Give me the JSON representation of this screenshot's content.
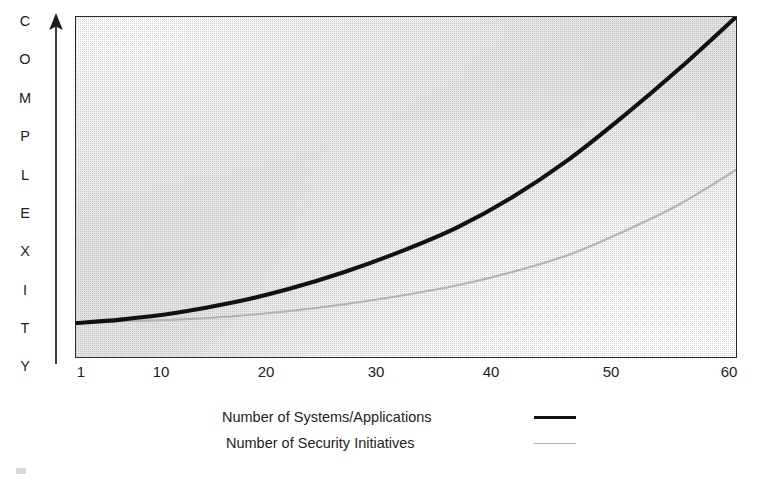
{
  "figure": {
    "y_axis_title": "COMPLEXITY",
    "y_axis_letters": [
      "C",
      "O",
      "M",
      "P",
      "L",
      "E",
      "X",
      "I",
      "T",
      "Y"
    ],
    "arrow_icon": "up-arrow-icon"
  },
  "legend": {
    "position": "below-plot",
    "items": [
      {
        "label": "Number of Systems/Applications",
        "style": "thick-solid",
        "color": "#111111"
      },
      {
        "label": "Number of Security Initiatives",
        "style": "thin-solid",
        "color": "#b3b3b3"
      }
    ]
  },
  "chart_data": {
    "type": "line",
    "title": "",
    "subtitle": "",
    "xlabel": "",
    "ylabel": "COMPLEXITY",
    "xlim": [
      1,
      60
    ],
    "ylim": [
      0,
      100
    ],
    "grid": false,
    "legend_position": "bottom",
    "x_tick_labels": [
      "1",
      "10",
      "20",
      "30",
      "40",
      "50",
      "60"
    ],
    "x_ticks": [
      1,
      10,
      20,
      30,
      40,
      50,
      60
    ],
    "y_tick_labels": [],
    "axis_note": "Y axis unlabeled/qualitative: increasing complexity",
    "x": [
      1,
      5,
      10,
      15,
      20,
      25,
      30,
      35,
      40,
      45,
      50,
      55,
      60
    ],
    "series": [
      {
        "name": "Number of Systems/Applications",
        "color": "#111111",
        "width": "thick",
        "values": [
          10,
          11,
          13,
          16,
          20,
          25,
          31,
          38,
          47,
          58,
          71,
          85,
          100
        ]
      },
      {
        "name": "Number of Security Initiatives",
        "color": "#b3b3b3",
        "width": "thin",
        "values": [
          10,
          10.5,
          11,
          12,
          13.5,
          15.5,
          18,
          21,
          25,
          30,
          37,
          45,
          55
        ]
      }
    ],
    "annotations": [],
    "background": "gray gradient fill inside plot frame"
  }
}
